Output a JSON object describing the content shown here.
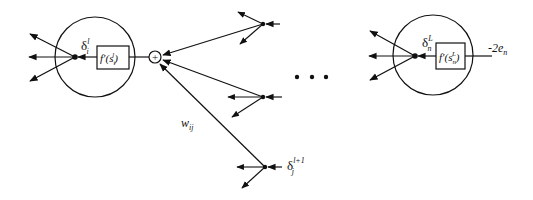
{
  "diagram": {
    "left_neuron": {
      "delta_label": "δ",
      "delta_sup": "l",
      "delta_sub": "i",
      "func_label": "f′(s",
      "func_sub": "i",
      "func_sup": "l",
      "func_close": ")"
    },
    "summation_node": {
      "symbol": "+"
    },
    "weight_label": {
      "base": "w",
      "sub": "ij"
    },
    "bottom_delta": {
      "base": "δ",
      "sup": "l+1",
      "sub": "j"
    },
    "ellipsis": "• • •",
    "right_neuron": {
      "delta_label": "δ",
      "delta_sup": "L",
      "delta_sub": "n",
      "func_label": "f′(s",
      "func_sub": "n",
      "func_sup": "L",
      "func_close": ")",
      "input_label": "-2e",
      "input_sub": "n"
    },
    "colors": {
      "stroke": "#111111",
      "background": "#ffffff"
    }
  }
}
